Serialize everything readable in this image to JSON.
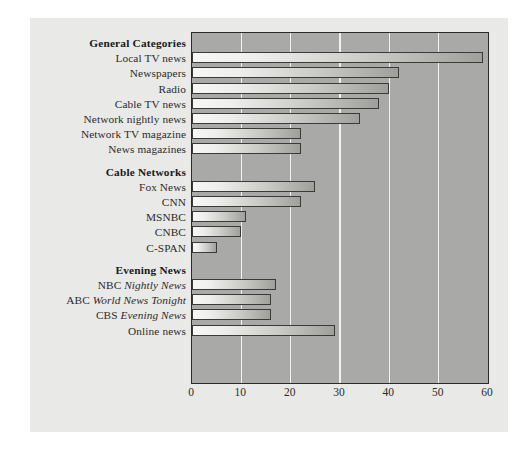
{
  "chart_data": {
    "type": "bar",
    "orientation": "horizontal",
    "title": "",
    "subtitle": "",
    "xlabel": "",
    "ylabel": "",
    "xlim": [
      0,
      60
    ],
    "xticks": [
      0,
      10,
      20,
      30,
      40,
      50,
      60
    ],
    "grid": true,
    "legend": null,
    "groups": [
      {
        "heading": "General Categories",
        "items": [
          {
            "label": "Local TV news",
            "value": 59
          },
          {
            "label": "Newspapers",
            "value": 42
          },
          {
            "label": "Radio",
            "value": 40
          },
          {
            "label": "Cable TV news",
            "value": 38
          },
          {
            "label": "Network nightly news",
            "value": 34
          },
          {
            "label": "Network TV magazine",
            "value": 22
          },
          {
            "label": "News magazines",
            "value": 22
          }
        ]
      },
      {
        "heading": "Cable Networks",
        "items": [
          {
            "label": "Fox News",
            "value": 25
          },
          {
            "label": "CNN",
            "value": 22
          },
          {
            "label": "MSNBC",
            "value": 11
          },
          {
            "label": "CNBC",
            "value": 10
          },
          {
            "label": "C-SPAN",
            "value": 5
          }
        ]
      },
      {
        "heading": "Evening News",
        "items": [
          {
            "label": "NBC Nightly News",
            "label_plain": "NBC ",
            "label_italic": "Nightly News",
            "value": 17
          },
          {
            "label": "ABC World News Tonight",
            "label_plain": "ABC ",
            "label_italic": "World News Tonight",
            "value": 16
          },
          {
            "label": "CBS Evening News",
            "label_plain": "CBS ",
            "label_italic": "Evening News",
            "value": 16
          },
          {
            "label": "Online news",
            "value": 29
          }
        ]
      }
    ],
    "categories": [
      "Local TV news",
      "Newspapers",
      "Radio",
      "Cable TV news",
      "Network nightly news",
      "Network TV magazine",
      "News magazines",
      "Fox News",
      "CNN",
      "MSNBC",
      "CNBC",
      "C-SPAN",
      "NBC Nightly News",
      "ABC World News Tonight",
      "CBS Evening News",
      "Online news"
    ],
    "values": [
      59,
      42,
      40,
      38,
      34,
      22,
      22,
      25,
      22,
      11,
      10,
      5,
      17,
      16,
      16,
      29
    ],
    "colors": {
      "plot_background": "#a9a9a7",
      "page_background": "#e9e9e7",
      "gridline": "#f2f2f0",
      "bar_light": "#f7f7f5",
      "bar_dark": "#9f9f9b",
      "bar_outline": "#3a3a38",
      "text": "#2b2b2b"
    }
  }
}
